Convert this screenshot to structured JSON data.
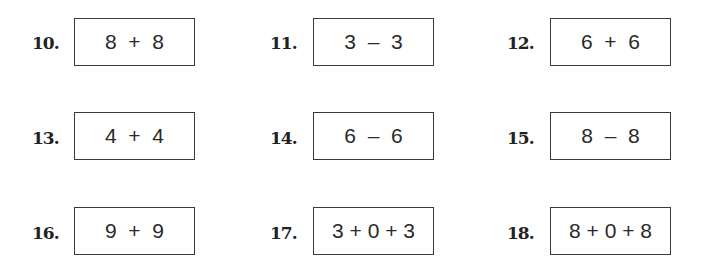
{
  "problems": [
    {
      "number": "10.",
      "expression": "8  +  8"
    },
    {
      "number": "11.",
      "expression": "3  –  3"
    },
    {
      "number": "12.",
      "expression": "6  +  6"
    },
    {
      "number": "13.",
      "expression": "4  +  4"
    },
    {
      "number": "14.",
      "expression": "6  –  6"
    },
    {
      "number": "15.",
      "expression": "8  –  8"
    },
    {
      "number": "16.",
      "expression": "9  +  9"
    },
    {
      "number": "17.",
      "expression": "3 + 0 + 3"
    },
    {
      "number": "18.",
      "expression": "8 + 0 + 8"
    }
  ]
}
